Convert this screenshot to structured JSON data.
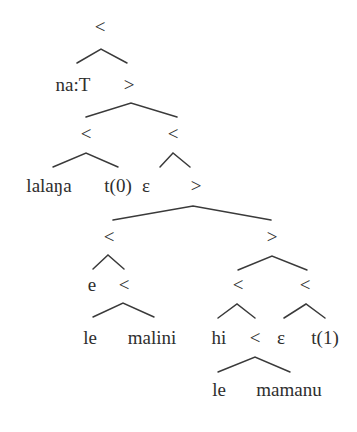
{
  "diagram": {
    "type": "syntax-tree",
    "colors": {
      "text": "#2e2e2e",
      "line": "#3a3a3a",
      "background": "#ffffff"
    },
    "nodes": [
      {
        "id": "n0",
        "label": "<",
        "x": 100,
        "y": 33
      },
      {
        "id": "n1",
        "label": "na:T",
        "x": 73,
        "y": 91
      },
      {
        "id": "n2",
        "label": ">",
        "x": 129,
        "y": 91
      },
      {
        "id": "n3",
        "label": "<",
        "x": 86,
        "y": 140
      },
      {
        "id": "n4",
        "label": "<",
        "x": 173,
        "y": 140
      },
      {
        "id": "n5",
        "label": "lalaŋa",
        "x": 49,
        "y": 192
      },
      {
        "id": "n6",
        "label": "t(0)",
        "x": 118,
        "y": 192
      },
      {
        "id": "n7",
        "label": "ε",
        "x": 146,
        "y": 192
      },
      {
        "id": "n8",
        "label": ">",
        "x": 196,
        "y": 192
      },
      {
        "id": "n9",
        "label": "<",
        "x": 109,
        "y": 243
      },
      {
        "id": "n10",
        "label": ">",
        "x": 272,
        "y": 243
      },
      {
        "id": "n11",
        "label": "e",
        "x": 92,
        "y": 291
      },
      {
        "id": "n12",
        "label": "<",
        "x": 124,
        "y": 291
      },
      {
        "id": "n13",
        "label": "<",
        "x": 238,
        "y": 291
      },
      {
        "id": "n14",
        "label": "<",
        "x": 305,
        "y": 291
      },
      {
        "id": "n15",
        "label": "le",
        "x": 90,
        "y": 344
      },
      {
        "id": "n16",
        "label": "malini",
        "x": 152,
        "y": 344
      },
      {
        "id": "n17",
        "label": "hi",
        "x": 219,
        "y": 344
      },
      {
        "id": "n18",
        "label": "<",
        "x": 255,
        "y": 344
      },
      {
        "id": "n19",
        "label": "ε",
        "x": 281,
        "y": 344
      },
      {
        "id": "n20",
        "label": "t(1)",
        "x": 325,
        "y": 344
      },
      {
        "id": "n21",
        "label": "le",
        "x": 219,
        "y": 396
      },
      {
        "id": "n22",
        "label": "mamanu",
        "x": 289,
        "y": 396
      }
    ],
    "branches": [
      {
        "parent": "n0",
        "left": [
          77,
          63
        ],
        "apex": [
          101,
          49
        ],
        "right": [
          127,
          63
        ]
      },
      {
        "parent": "n2",
        "left": [
          86,
          117
        ],
        "apex": [
          131,
          103
        ],
        "right": [
          177,
          117
        ]
      },
      {
        "parent": "n3",
        "left": [
          53,
          167
        ],
        "apex": [
          86,
          153
        ],
        "right": [
          118,
          167
        ]
      },
      {
        "parent": "n4",
        "left": [
          160,
          167
        ],
        "apex": [
          173,
          153
        ],
        "right": [
          190,
          167
        ]
      },
      {
        "parent": "n8",
        "left": [
          113,
          220
        ],
        "apex": [
          193,
          206
        ],
        "right": [
          271,
          220
        ]
      },
      {
        "parent": "n9",
        "left": [
          93,
          269
        ],
        "apex": [
          108,
          255
        ],
        "right": [
          124,
          269
        ]
      },
      {
        "parent": "n10",
        "left": [
          238,
          270
        ],
        "apex": [
          272,
          256
        ],
        "right": [
          307,
          270
        ]
      },
      {
        "parent": "n12",
        "left": [
          93,
          317
        ],
        "apex": [
          123,
          303
        ],
        "right": [
          154,
          317
        ]
      },
      {
        "parent": "n13",
        "left": [
          218,
          318
        ],
        "apex": [
          237,
          304
        ],
        "right": [
          255,
          318
        ]
      },
      {
        "parent": "n14",
        "left": [
          284,
          318
        ],
        "apex": [
          306,
          304
        ],
        "right": [
          325,
          318
        ]
      },
      {
        "parent": "n18",
        "left": [
          218,
          372
        ],
        "apex": [
          255,
          357
        ],
        "right": [
          290,
          372
        ]
      }
    ]
  }
}
